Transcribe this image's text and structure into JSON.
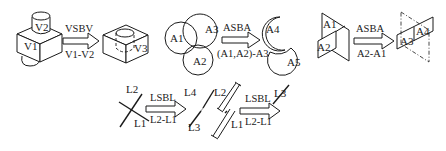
{
  "diagrams": {
    "vsbv": {
      "operation": "VSBV",
      "expression": "V1-V2",
      "inputs": [
        "V1",
        "V2"
      ],
      "output": "V3"
    },
    "asba_circles": {
      "operation": "ASBA",
      "expression": "(A1,A2)-A3",
      "inputs": [
        "A1",
        "A2",
        "A3"
      ],
      "outputs": [
        "A4",
        "A5"
      ]
    },
    "asba_planes": {
      "operation": "ASBA",
      "expression": "A2-A1",
      "inputs": [
        "A1",
        "A2"
      ],
      "outputs": [
        "A3",
        "A4"
      ]
    },
    "lsbl_cross": {
      "operation": "LSBL",
      "expression": "L2-L1",
      "inputs": [
        "L1",
        "L2"
      ],
      "outputs": [
        "L3",
        "L4"
      ]
    },
    "lsbl_overlap": {
      "operation": "LSBL",
      "expression": "L2-L1",
      "inputs": [
        "L1",
        "L2"
      ],
      "output": "L3"
    }
  }
}
